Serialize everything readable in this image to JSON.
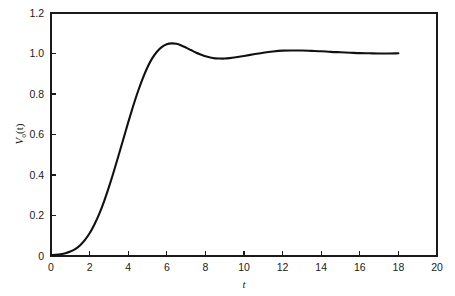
{
  "chart_data": {
    "type": "line",
    "title": "",
    "subtitle": "",
    "xlabel": "t",
    "ylabel": "V_o(t)",
    "ylabel_parts": {
      "variable": "V",
      "subscript": "o",
      "argument": "(t)"
    },
    "xlim": [
      0,
      20
    ],
    "ylim": [
      0,
      1.2
    ],
    "xticks": [
      0,
      2,
      4,
      6,
      8,
      10,
      12,
      14,
      16,
      18,
      20
    ],
    "xtick_labels": [
      "0",
      "2",
      "4",
      "6",
      "8",
      "10",
      "12",
      "14",
      "16",
      "18",
      "20"
    ],
    "yticks": [
      0,
      0.2,
      0.4,
      0.6,
      0.8,
      1.0,
      1.2
    ],
    "ytick_labels": [
      "0",
      "0.2",
      "0.4",
      "0.6",
      "0.8",
      "1.0",
      "1.2"
    ],
    "grid": false,
    "legend": null,
    "legend_position": "none",
    "annotations": [],
    "line_color": "#111111",
    "axis_color": "#1a1a1a",
    "background_color": "#ffffff",
    "series": [
      {
        "name": "V_o(t)",
        "x": [
          0.0,
          0.25,
          0.5,
          0.75,
          1.0,
          1.25,
          1.5,
          1.75,
          2.0,
          2.25,
          2.5,
          2.75,
          3.0,
          3.25,
          3.5,
          3.75,
          4.0,
          4.25,
          4.5,
          4.75,
          5.0,
          5.25,
          5.5,
          5.75,
          6.0,
          6.25,
          6.5,
          6.75,
          7.0,
          7.25,
          7.5,
          7.75,
          8.0,
          8.25,
          8.5,
          8.75,
          9.0,
          9.25,
          9.5,
          9.75,
          10.0,
          10.5,
          11.0,
          11.5,
          12.0,
          12.5,
          13.0,
          13.5,
          14.0,
          14.5,
          15.0,
          15.5,
          16.0,
          16.5,
          17.0,
          17.5,
          18.0
        ],
        "y": [
          0.005,
          0.006,
          0.009,
          0.014,
          0.022,
          0.034,
          0.052,
          0.078,
          0.112,
          0.156,
          0.208,
          0.27,
          0.34,
          0.416,
          0.496,
          0.578,
          0.66,
          0.738,
          0.811,
          0.876,
          0.932,
          0.977,
          1.01,
          1.033,
          1.046,
          1.05,
          1.048,
          1.04,
          1.029,
          1.017,
          1.005,
          0.995,
          0.986,
          0.98,
          0.976,
          0.975,
          0.975,
          0.977,
          0.98,
          0.984,
          0.988,
          0.996,
          1.004,
          1.01,
          1.014,
          1.015,
          1.015,
          1.013,
          1.011,
          1.008,
          1.006,
          1.004,
          1.002,
          1.001,
          1.0,
          1.0,
          1.001
        ],
        "overshoot_peak": {
          "x": 5.6,
          "y": 1.11
        },
        "first_trough": {
          "x": 8.8,
          "y": 0.975
        },
        "second_peak": {
          "x": 12.5,
          "y": 1.015
        },
        "final_value": {
          "x": 18,
          "y": 1.0
        }
      }
    ]
  },
  "figure": {
    "plot_area": {
      "left": 51,
      "top": 13,
      "right": 437,
      "bottom": 256
    }
  }
}
